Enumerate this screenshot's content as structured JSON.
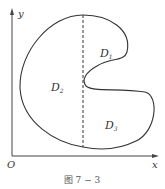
{
  "figure": {
    "caption": "图 7 − 3",
    "axes": {
      "origin_label": "O",
      "x_label": "x",
      "y_label": "y"
    },
    "regions": [
      {
        "name": "D",
        "sub": "1"
      },
      {
        "name": "D",
        "sub": "2"
      },
      {
        "name": "D",
        "sub": "3"
      }
    ],
    "colors": {
      "stroke": "#333333",
      "axis": "#444444",
      "background": "#ffffff"
    }
  }
}
